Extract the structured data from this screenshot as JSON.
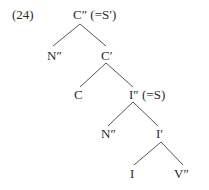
{
  "example_number": "(24)",
  "tree": {
    "root": {
      "label": "C″ (=S′)"
    },
    "n1": {
      "label": "N″"
    },
    "c_bar": {
      "label": "C′"
    },
    "c": {
      "label": "C"
    },
    "i_dbl": {
      "label": "I″ (=S)"
    },
    "n2": {
      "label": "N″"
    },
    "i_bar": {
      "label": "I′"
    },
    "i": {
      "label": "I"
    },
    "v_dbl": {
      "label": "V″"
    }
  },
  "edges": [
    {
      "from": "root",
      "to": "n1"
    },
    {
      "from": "root",
      "to": "c_bar"
    },
    {
      "from": "c_bar",
      "to": "c"
    },
    {
      "from": "c_bar",
      "to": "i_dbl"
    },
    {
      "from": "i_dbl",
      "to": "n2"
    },
    {
      "from": "i_dbl",
      "to": "i_bar"
    },
    {
      "from": "i_bar",
      "to": "i"
    },
    {
      "from": "i_bar",
      "to": "v_dbl"
    }
  ]
}
